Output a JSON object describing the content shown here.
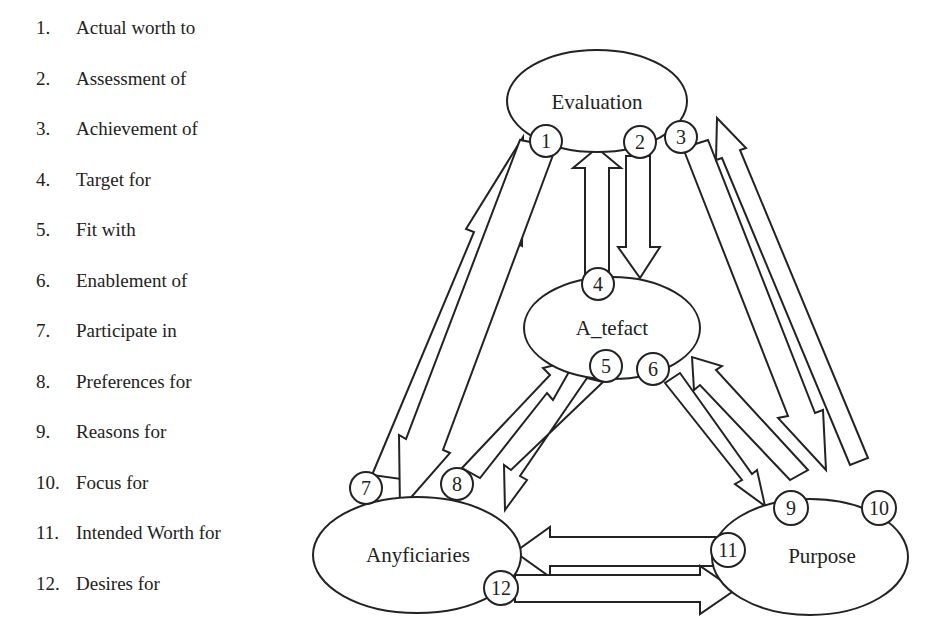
{
  "legend": {
    "items": [
      {
        "num": "1.",
        "label": "Actual worth to"
      },
      {
        "num": "2.",
        "label": "Assessment of"
      },
      {
        "num": "3.",
        "label": "Achievement of"
      },
      {
        "num": "4.",
        "label": "Target for"
      },
      {
        "num": "5.",
        "label": "Fit with"
      },
      {
        "num": "6.",
        "label": "Enablement of"
      },
      {
        "num": "7.",
        "label": "Participate in"
      },
      {
        "num": "8.",
        "label": "Preferences for"
      },
      {
        "num": "9.",
        "label": "Reasons for"
      },
      {
        "num": "10.",
        "label": "Focus for"
      },
      {
        "num": "11.",
        "label": "Intended Worth for"
      },
      {
        "num": "12.",
        "label": "Desires for"
      }
    ]
  },
  "nodes": {
    "evaluation": "Evaluation",
    "artefact": "A_tefact",
    "beneficiaries": "Anyficiaries",
    "purpose": "Purpose"
  },
  "markers": {
    "m1": "1",
    "m2": "2",
    "m3": "3",
    "m4": "4",
    "m5": "5",
    "m6": "6",
    "m7": "7",
    "m8": "8",
    "m9": "9",
    "m10": "10",
    "m11": "11",
    "m12": "12"
  },
  "colors": {
    "stroke": "#222222",
    "background": "#ffffff"
  }
}
